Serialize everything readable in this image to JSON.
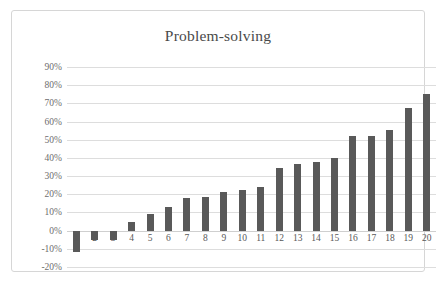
{
  "chart_data": {
    "type": "bar",
    "title": "Problem-solving",
    "xlabel": "",
    "ylabel": "",
    "categories": [
      "1",
      "2",
      "3",
      "4",
      "5",
      "6",
      "7",
      "8",
      "9",
      "10",
      "11",
      "12",
      "13",
      "14",
      "15",
      "16",
      "17",
      "18",
      "19",
      "20"
    ],
    "values": [
      -12,
      -5,
      -5,
      5,
      9,
      13,
      18,
      18.5,
      21.5,
      22.5,
      24,
      34.5,
      36.5,
      38,
      40,
      52,
      52,
      55.5,
      67.5,
      75
    ],
    "value_labels": [
      "-12%",
      "-5%",
      "-5%",
      "5%",
      "9%",
      "13%",
      "18%",
      "18.5%",
      "21.5%",
      "22.5%",
      "24%",
      "34.5%",
      "36.5%",
      "38%",
      "40%",
      "52%",
      "52%",
      "55.5%",
      "67.5%",
      "75%"
    ],
    "ylim": [
      -20,
      90
    ],
    "ytick_values": [
      90,
      80,
      70,
      60,
      50,
      40,
      30,
      20,
      10,
      0,
      -10,
      -20
    ],
    "ytick_labels": [
      "90%",
      "80%",
      "70%",
      "60%",
      "50%",
      "40%",
      "30%",
      "20%",
      "10%",
      "0%",
      "-10%",
      "-20%"
    ],
    "grid": true,
    "legend": false,
    "series_color": "#595959",
    "gridline_color": "#dddddd",
    "frame_color": "#d6d6d6",
    "title_color": "#4a4a4a",
    "tick_color": "#6e6e6e"
  }
}
